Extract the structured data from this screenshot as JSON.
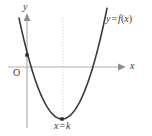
{
  "figure": {
    "background_color": "#ffffff",
    "width": 152,
    "height": 136
  },
  "axes": {
    "color": "#b0b0b0",
    "x_axis": {
      "name": "x-axis",
      "label": "x",
      "y_pixel": 67,
      "from_x": 8,
      "to_x": 126,
      "arrow": "right"
    },
    "y_axis": {
      "name": "y-axis",
      "label": "y",
      "x_pixel": 27,
      "from_y": 128,
      "to_y": 13,
      "arrow": "up"
    },
    "origin_label": "O"
  },
  "curve": {
    "name": "parabola",
    "label": "y = f(x)",
    "label_parts": {
      "lhs": "y",
      "eq": "=",
      "rhs_fn": "f",
      "open": "(",
      "arg": "x",
      "close": ")"
    },
    "color": "#3a3a3a",
    "stroke_width": 1.6
  },
  "symmetry_line": {
    "name": "axis-of-symmetry",
    "label": "x = k",
    "label_parts": {
      "lhs": "x",
      "eq": "=",
      "rhs": "k"
    },
    "color": "#cfcfcf",
    "dash": "1,2",
    "x_pixel": 63,
    "from_y": 18,
    "to_y": 124
  },
  "markers": [
    {
      "name": "y-intercept-point",
      "x": 27,
      "y": 55,
      "color": "#2b2b2b",
      "size": 3.4
    },
    {
      "name": "vertex-point",
      "x": 62,
      "y": 119,
      "color": "#2b2b2b",
      "size": 3.4
    }
  ],
  "chart_data": {
    "type": "line",
    "xlabel": "x",
    "ylabel": "y",
    "grid": false,
    "legend": null,
    "annotations": [
      {
        "text": "y = f(x)",
        "at_pixel": [
          108,
          21
        ],
        "describes": "curve-label"
      },
      {
        "text": "x = k",
        "at_pixel": [
          56,
          127
        ],
        "describes": "axis-of-symmetry-label"
      },
      {
        "text": "O",
        "at_pixel": [
          17,
          73
        ],
        "describes": "origin-label"
      },
      {
        "text": "y",
        "at_pixel": [
          26,
          7
        ],
        "describes": "y-axis-label"
      },
      {
        "text": "x",
        "at_pixel": [
          133,
          67
        ],
        "describes": "x-axis-label"
      }
    ],
    "series": [
      {
        "name": "f(x)",
        "shape": "parabola-opening-upward",
        "pixel_points": [
          [
            19,
            18
          ],
          [
            24,
            44
          ],
          [
            27,
            55
          ],
          [
            33,
            67
          ],
          [
            40,
            88
          ],
          [
            48,
            104
          ],
          [
            55,
            114
          ],
          [
            62,
            119
          ],
          [
            70,
            117
          ],
          [
            78,
            108
          ],
          [
            86,
            92
          ],
          [
            92,
            78
          ],
          [
            96,
            67
          ],
          [
            102,
            44
          ],
          [
            107,
            18
          ]
        ],
        "vertex_pixel": [
          62,
          119
        ],
        "y_intercept_pixel": [
          27,
          55
        ],
        "x_intercepts_pixel": [
          [
            33,
            67
          ],
          [
            96,
            67
          ]
        ]
      }
    ]
  }
}
